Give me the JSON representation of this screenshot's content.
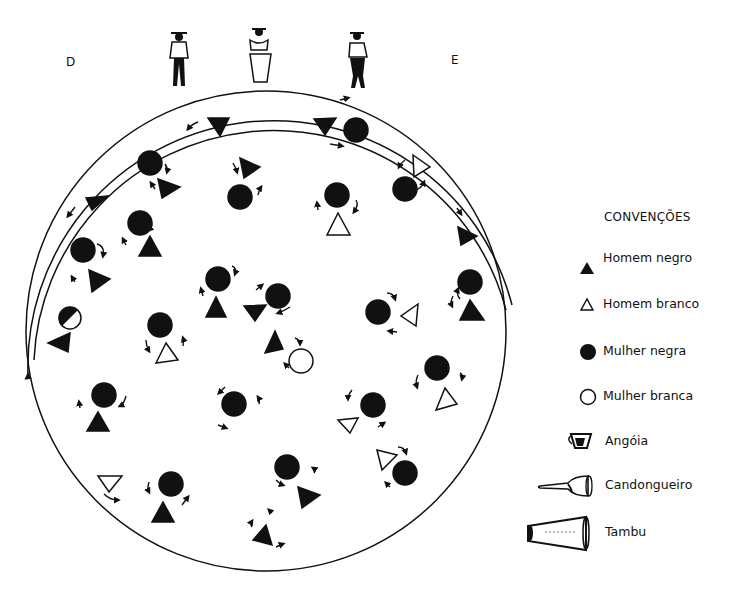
{
  "labels": {
    "left": "D",
    "right": "E"
  },
  "legend": {
    "title": "CONVENÇÕES",
    "items": [
      {
        "symbol": "filled-triangle",
        "label": "Homem negro"
      },
      {
        "symbol": "outline-triangle",
        "label": "Homem branco"
      },
      {
        "symbol": "filled-circle",
        "label": "Mulher negra"
      },
      {
        "symbol": "outline-circle",
        "label": "Mulher branca"
      },
      {
        "symbol": "angoia-drum",
        "label": "Angóia"
      },
      {
        "symbol": "candongueiro-drum",
        "label": "Candongueiro"
      },
      {
        "symbol": "tambu-drum",
        "label": "Tambu"
      }
    ]
  },
  "musicians": [
    "angoia-player",
    "tambu-player",
    "candongueiro-player"
  ],
  "colors": {
    "ink": "#111111",
    "background": "#ffffff"
  }
}
